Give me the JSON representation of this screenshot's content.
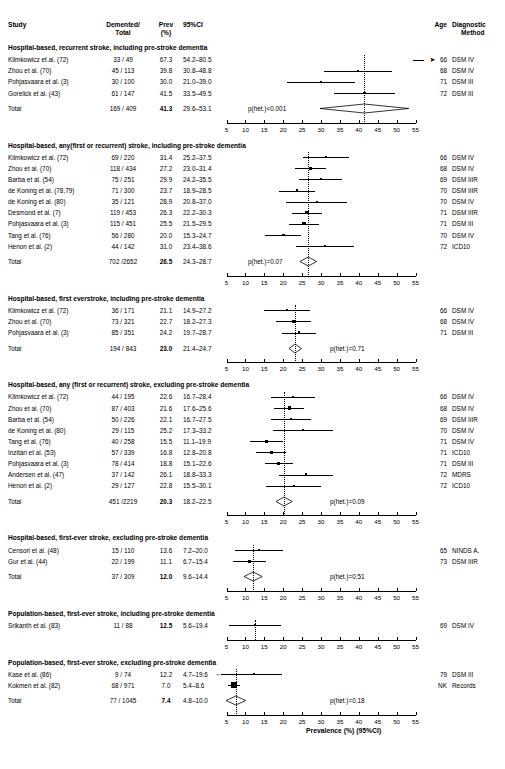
{
  "figure": {
    "axis_title": "Prevalence (%) (95%CI)",
    "axis_ticks": [
      5,
      10,
      15,
      20,
      25,
      30,
      35,
      40,
      45,
      50,
      55
    ],
    "axis_min": 5,
    "axis_max": 55
  },
  "columns": {
    "study": "Study",
    "demented_total_line1": "Demented/",
    "demented_total_line2": "Total",
    "prev_line1": "Prev",
    "prev_line2": "(%)",
    "ci": "95%CI",
    "age": "Age",
    "dx_line1": "Diagnostic",
    "dx_line2": "Method",
    "total_label": "Total"
  },
  "chart_data": {
    "type": "forest",
    "title": "",
    "xlabel": "Prevalence (%) (95%CI)",
    "ylabel": "",
    "xlim": [
      5,
      55
    ],
    "xticks": [
      5,
      10,
      15,
      20,
      25,
      30,
      35,
      40,
      45,
      50,
      55
    ],
    "grid": false,
    "legend": "none",
    "sections": [
      {
        "heading": "Hospital-based, recurrent stroke, including pre-stroke dementia",
        "rows": [
          {
            "study": "Klimkowicz et al. (72)",
            "dt": "33 / 49",
            "prev": "67.3",
            "ci": "54.2–80.5",
            "value": 67.3,
            "low": 54.2,
            "high": 80.5,
            "age": "66",
            "dx": "DSM IV",
            "off_scale_right": true
          },
          {
            "study": "Zhou et al. (70)",
            "dt": "45 / 113",
            "prev": "39.8",
            "ci": "30.8–48.8",
            "value": 39.8,
            "low": 30.8,
            "high": 48.8,
            "age": "68",
            "dx": "DSM IV"
          },
          {
            "study": "Pohjasvaara et al. (3)",
            "dt": "30 / 100",
            "prev": "30.0",
            "ci": "21.0–39.0",
            "value": 30.0,
            "low": 21.0,
            "high": 39.0,
            "age": "71",
            "dx": "DSM III"
          },
          {
            "study": "Gorelick et al. (43)",
            "dt": "61 / 147",
            "prev": "41.5",
            "ci": "33.5–49.5",
            "value": 41.5,
            "low": 33.5,
            "high": 49.5,
            "age": "72",
            "dx": "DSM III"
          }
        ],
        "total": {
          "dt": "169 / 409",
          "prev": "41.3",
          "ci": "29.6–53.1",
          "value": 41.3,
          "low": 29.6,
          "high": 53.1,
          "phet": "p(het.)<0.001"
        }
      },
      {
        "heading": "Hospital-based, any(first or recurrent) stroke, including pre-stroke dementia",
        "rows": [
          {
            "study": "Klimkowicz et al. (72)",
            "dt": "69 / 220",
            "prev": "31.4",
            "ci": "25.2–37.5",
            "value": 31.4,
            "low": 25.2,
            "high": 37.5,
            "age": "66",
            "dx": "DSM IV"
          },
          {
            "study": "Zhou et al. (70)",
            "dt": "118 / 434",
            "prev": "27.2",
            "ci": "23.0–31.4",
            "value": 27.2,
            "low": 23.0,
            "high": 31.4,
            "age": "68",
            "dx": "DSM IV"
          },
          {
            "study": "Barba et al. (54)",
            "dt": "75 / 251",
            "prev": "29.9",
            "ci": "24.2–35.5",
            "value": 29.9,
            "low": 24.2,
            "high": 35.5,
            "age": "69",
            "dx": "DSM IIIR"
          },
          {
            "study": "de Koning et al. (78,79)",
            "dt": "71 / 300",
            "prev": "23.7",
            "ci": "18.9–28.5",
            "value": 23.7,
            "low": 18.9,
            "high": 28.5,
            "age": "70",
            "dx": "DSM IIIR"
          },
          {
            "study": "de Koning et al. (80)",
            "dt": "35 / 121",
            "prev": "28.9",
            "ci": "20.8–37.0",
            "value": 28.9,
            "low": 20.8,
            "high": 37.0,
            "age": "70",
            "dx": "DSM IV"
          },
          {
            "study": "Desmond et al. (7)",
            "dt": "119 / 453",
            "prev": "26.3",
            "ci": "22.2–30.3",
            "value": 26.3,
            "low": 22.2,
            "high": 30.3,
            "age": "71",
            "dx": "DSM IIIR"
          },
          {
            "study": "Pohjasvaara et al. (3)",
            "dt": "115 / 451",
            "prev": "25.5",
            "ci": "21.5–29.5",
            "value": 25.5,
            "low": 21.5,
            "high": 29.5,
            "age": "71",
            "dx": "DSM III"
          },
          {
            "study": "Tang et al. (76)",
            "dt": "56 / 280",
            "prev": "20.0",
            "ci": "15.3–24.7",
            "value": 20.0,
            "low": 15.3,
            "high": 24.7,
            "age": "70",
            "dx": "DSM IV"
          },
          {
            "study": "Henon et al. (2)",
            "dt": "44 / 142",
            "prev": "31.0",
            "ci": "23.4–38.6",
            "value": 31.0,
            "low": 23.4,
            "high": 38.6,
            "age": "72",
            "dx": "ICD10"
          }
        ],
        "total": {
          "dt": "702  /2652",
          "prev": "26.5",
          "ci": "24.3–28.7",
          "value": 26.5,
          "low": 24.3,
          "high": 28.7,
          "phet": "p(het.)=0.07"
        }
      },
      {
        "heading": "Hospital-based, first everstroke, including pre-stroke dementia",
        "rows": [
          {
            "study": "Klimkowicz et al. (72)",
            "dt": "36 / 171",
            "prev": "21.1",
            "ci": "14.9–27.2",
            "value": 21.1,
            "low": 14.9,
            "high": 27.2,
            "age": "66",
            "dx": "DSM IV"
          },
          {
            "study": "Zhou et al. (70)",
            "dt": "73 / 321",
            "prev": "22.7",
            "ci": "18.2–27.3",
            "value": 22.7,
            "low": 18.2,
            "high": 27.3,
            "age": "68",
            "dx": "DSM IV"
          },
          {
            "study": "Pohjasvaara et al. (3)",
            "dt": "85 / 351",
            "prev": "24.2",
            "ci": "19.7–28.7",
            "value": 24.2,
            "low": 19.7,
            "high": 28.7,
            "age": "71",
            "dx": "DSM III"
          }
        ],
        "total": {
          "dt": "194 / 843",
          "prev": "23.0",
          "ci": "21.4–24.7",
          "value": 23.0,
          "low": 21.4,
          "high": 24.7,
          "phet": "p(het.)=0.71"
        }
      },
      {
        "heading": "Hospital-based, any (first or recurrent) stroke, excluding pre-stroke dementia",
        "rows": [
          {
            "study": "Klimkowicz et al. (72)",
            "dt": "44 / 195",
            "prev": "22.6",
            "ci": "16.7–28.4",
            "value": 22.6,
            "low": 16.7,
            "high": 28.4,
            "age": "66",
            "dx": "DSM IV"
          },
          {
            "study": "Zhou et al. (70)",
            "dt": "87 / 403",
            "prev": "21.6",
            "ci": "17.6–25.6",
            "value": 21.6,
            "low": 17.6,
            "high": 25.6,
            "age": "68",
            "dx": "DSM IV"
          },
          {
            "study": "Barba et al. (54)",
            "dt": "50 / 226",
            "prev": "22.1",
            "ci": "16.7–27.5",
            "value": 22.1,
            "low": 16.7,
            "high": 27.5,
            "age": "69",
            "dx": "DSM IIIR"
          },
          {
            "study": "de Koning et al. (80)",
            "dt": "29 / 115",
            "prev": "25.2",
            "ci": "17.3–33.2",
            "value": 25.2,
            "low": 17.3,
            "high": 33.2,
            "age": "70",
            "dx": "DSM IV"
          },
          {
            "study": "Tang et al. (76)",
            "dt": "40 / 258",
            "prev": "15.5",
            "ci": "11.1–19.9",
            "value": 15.5,
            "low": 11.1,
            "high": 19.9,
            "age": "71",
            "dx": "DSM IV"
          },
          {
            "study": "Inzitari et al. (53)",
            "dt": "57 / 339",
            "prev": "16.8",
            "ci": "12.8–20.8",
            "value": 16.8,
            "low": 12.8,
            "high": 20.8,
            "age": "71",
            "dx": "ICD10"
          },
          {
            "study": "Pohjasvaara et al. (3)",
            "dt": "78 / 414",
            "prev": "18.8",
            "ci": "15.1–22.6",
            "value": 18.8,
            "low": 15.1,
            "high": 22.6,
            "age": "71",
            "dx": "DSM III"
          },
          {
            "study": "Andersen et al. (47)",
            "dt": "37 / 142",
            "prev": "26.1",
            "ci": "18.8–33.3",
            "value": 26.1,
            "low": 18.8,
            "high": 33.3,
            "age": "72",
            "dx": "MDRS"
          },
          {
            "study": "Henon et al. (2)",
            "dt": "29 / 127",
            "prev": "22.8",
            "ci": "15.5–30.1",
            "value": 22.8,
            "low": 15.5,
            "high": 30.1,
            "age": "72",
            "dx": "ICD10"
          }
        ],
        "total": {
          "dt": "451  /2219",
          "prev": "20.3",
          "ci": "18.2–22.5",
          "value": 20.3,
          "low": 18.2,
          "high": 22.5,
          "phet": "p(het.)=0.09"
        }
      },
      {
        "heading": "Hospital-based, first-ever stroke, excluding pre-stroke dementia",
        "rows": [
          {
            "study": "Censori et al. (48)",
            "dt": "15 / 110",
            "prev": "13.6",
            "ci": "7.2–20.0",
            "value": 13.6,
            "low": 7.2,
            "high": 20.0,
            "age": "65",
            "dx": "NINDS A."
          },
          {
            "study": "Gur et al. (44)",
            "dt": "22 / 199",
            "prev": "11.1",
            "ci": "6.7–15.4",
            "value": 11.1,
            "low": 6.7,
            "high": 15.4,
            "age": "73",
            "dx": "DSM IIIR"
          }
        ],
        "total": {
          "dt": "37 / 309",
          "prev": "12.0",
          "ci": "9.6–14.4",
          "value": 12.0,
          "low": 9.6,
          "high": 14.4,
          "phet": "p(het.)=0.51"
        }
      },
      {
        "heading": "Population-based, first-ever stroke, including pre-stroke dementia",
        "rows": [
          {
            "study": "Srikanth et al. (83)",
            "dt": "11 / 88",
            "prev": "12.5",
            "ci": "5.6–19.4",
            "value": 12.5,
            "low": 5.6,
            "high": 19.4,
            "age": "69",
            "dx": "DSM IV",
            "prev_bold": true
          }
        ],
        "total": null
      },
      {
        "heading": "Population-based, first-ever stroke, excluding pre-stroke dementia",
        "rows": [
          {
            "study": "Kase et al. (86)",
            "dt": "9 / 74",
            "prev": "12.2",
            "ci": "4.7–19.6",
            "value": 12.2,
            "low": 4.7,
            "high": 19.6,
            "age": "79",
            "dx": "DSM III",
            "off_scale_left": true
          },
          {
            "study": "Kokmen et al. (82)",
            "dt": "68 / 971",
            "prev": "7.0",
            "ci": "5.4–8.6",
            "value": 7.0,
            "low": 5.4,
            "high": 8.6,
            "age": "NK",
            "dx": "Records"
          }
        ],
        "total": {
          "dt": "77 / 1045",
          "prev": "7.4",
          "ci": "4.8–10.0",
          "value": 7.4,
          "low": 4.8,
          "high": 10.0,
          "phet": "p(het.)=0.18"
        }
      }
    ]
  }
}
